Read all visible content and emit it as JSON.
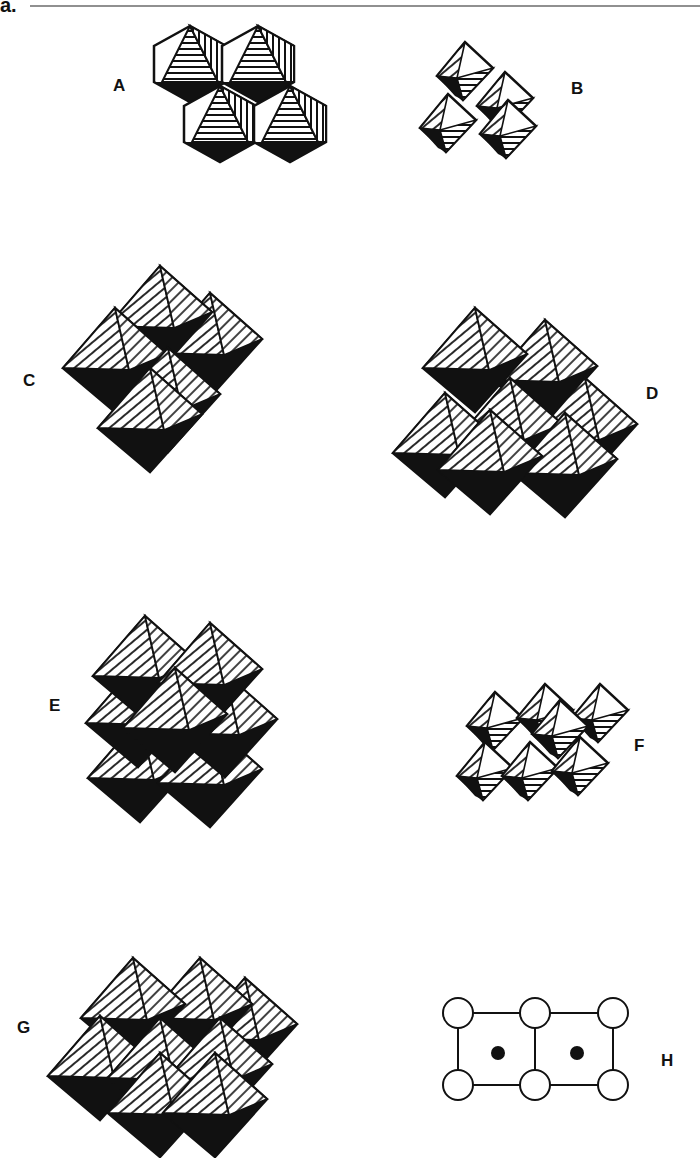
{
  "header": {
    "partial_label": "a.",
    "rule_color": "#222222"
  },
  "panels": [
    {
      "id": "A",
      "label": "A",
      "description": "four edge-sharing octahedra, polyhedral layer view"
    },
    {
      "id": "B",
      "label": "B",
      "description": "small cluster of corner-sharing octahedra"
    },
    {
      "id": "C",
      "label": "C",
      "description": "stacked octahedral framework (2x2 block)"
    },
    {
      "id": "D",
      "label": "D",
      "description": "octahedral framework (2x3 block)"
    },
    {
      "id": "E",
      "label": "E",
      "description": "octahedral framework, offset stacking"
    },
    {
      "id": "F",
      "label": "F",
      "description": "corner-linked octahedral chain/layer, small scale"
    },
    {
      "id": "G",
      "label": "G",
      "description": "octahedral framework (3x2 block)"
    },
    {
      "id": "H",
      "label": "H",
      "description": "2D unit cell schematic: open circles at corners and edge midpoints, filled dots at cell centers"
    }
  ],
  "schematic_H": {
    "open_circles": 6,
    "filled_dots": 2,
    "cells": 2
  },
  "colors": {
    "ink": "#111111",
    "paper": "#ffffff"
  }
}
